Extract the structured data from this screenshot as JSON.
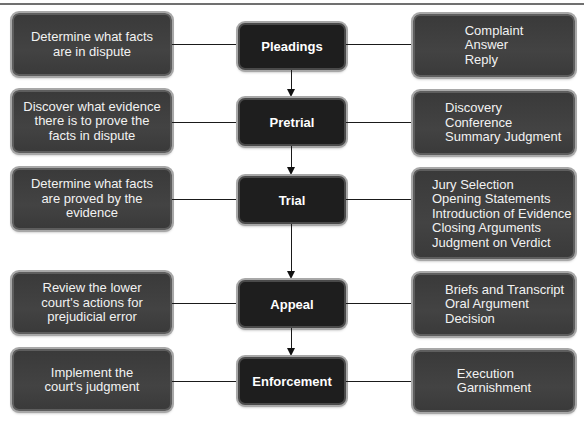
{
  "diagram": {
    "stages": [
      {
        "name": "Pleadings",
        "purpose": [
          "Determine what facts",
          "are in dispute"
        ],
        "steps": [
          "Complaint",
          "Answer",
          "Reply"
        ]
      },
      {
        "name": "Pretrial",
        "purpose": [
          "Discover what evidence",
          "there is to prove the",
          "facts in dispute"
        ],
        "steps": [
          "Discovery",
          "Conference",
          "Summary Judgment"
        ]
      },
      {
        "name": "Trial",
        "purpose": [
          "Determine what facts",
          "are proved by the",
          "evidence"
        ],
        "steps": [
          "Jury Selection",
          "Opening Statements",
          "Introduction of Evidence",
          "Closing Arguments",
          "Judgment on Verdict"
        ]
      },
      {
        "name": "Appeal",
        "purpose": [
          "Review the lower",
          "court's actions for",
          "prejudicial error"
        ],
        "steps": [
          "Briefs and Transcript",
          "Oral Argument",
          "Decision"
        ]
      },
      {
        "name": "Enforcement",
        "purpose": [
          "Implement the",
          "court's judgment"
        ],
        "steps": [
          "Execution",
          "Garnishment"
        ]
      }
    ],
    "colors": {
      "center_box": "#1e1e1e",
      "side_box": "#3d3d3d",
      "box_border": "#a8a8a8",
      "connector": "#1a1a1a",
      "text": "#f2f2f2"
    }
  }
}
